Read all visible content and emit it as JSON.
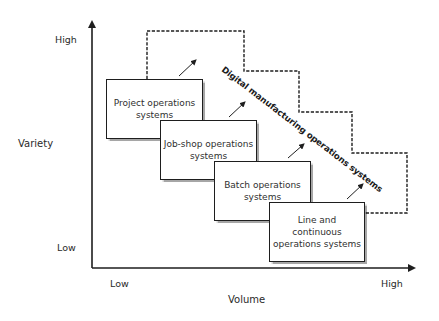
{
  "axes": {
    "y_label": "Variety",
    "y_high": "High",
    "y_low": "Low",
    "x_label": "Volume",
    "x_low": "Low",
    "x_high": "High"
  },
  "boxes": [
    {
      "line1": "Project operations",
      "line2": "systems"
    },
    {
      "line1": "Job-shop operations",
      "line2": "systems"
    },
    {
      "line1": "Batch operations",
      "line2": "systems"
    },
    {
      "line1": "Line and continuous",
      "line2": "operations systems"
    }
  ],
  "dashed_region_label": "Digital manufacturing operations systems",
  "colors": {
    "stroke": "#1e1e1e",
    "text": "#2a2a2a",
    "background": "#ffffff"
  }
}
